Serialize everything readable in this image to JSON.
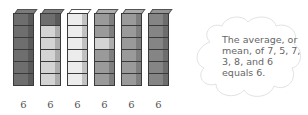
{
  "figure": {
    "towers": [
      {
        "value_label": "6",
        "cubes": [
          "dark",
          "dark",
          "dark",
          "dark",
          "dark",
          "dark"
        ]
      },
      {
        "value_label": "6",
        "cubes": [
          "dark",
          "light",
          "light",
          "light",
          "light",
          "light"
        ]
      },
      {
        "value_label": "6",
        "cubes": [
          "vlight",
          "vlight",
          "vlight",
          "vlight",
          "vlight",
          "vlight"
        ]
      },
      {
        "value_label": "6",
        "cubes": [
          "medium",
          "medium",
          "light",
          "medium",
          "medium",
          "medium"
        ]
      },
      {
        "value_label": "6",
        "cubes": [
          "medium",
          "medium",
          "medium",
          "medium",
          "medium",
          "medium"
        ]
      },
      {
        "value_label": "6",
        "cubes": [
          "mdark",
          "mdark",
          "mdark",
          "mdark",
          "mdark",
          "mdark"
        ]
      }
    ],
    "callout": {
      "lines": [
        "The average, or",
        "mean, of 7, 5, 7,",
        "3, 8, and 6",
        "equals 6."
      ]
    },
    "colors": {
      "dark": "#6e6e6e",
      "mdark": "#858585",
      "medium": "#9a9a9a",
      "light": "#d4d4d4",
      "vlight": "#ececec",
      "outline": "#3a3a3a",
      "cloud_outline": "#e2e2e2",
      "text": "#666666"
    }
  }
}
